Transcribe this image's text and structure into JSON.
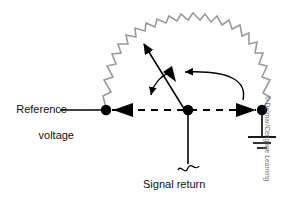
{
  "figure": {
    "type": "electrical-schematic",
    "background_color": "#ffffff",
    "wire_color": "#000000",
    "resistor_color": "#9a9a9a",
    "credit": "© Delmar/Cengage Learning"
  },
  "labels": {
    "reference_voltage_line1": "Reference",
    "reference_voltage_line2": "voltage",
    "signal_return": "Signal return"
  },
  "nodes": [
    {
      "name": "left-node",
      "x": 106,
      "y": 110
    },
    {
      "name": "center-node",
      "x": 188,
      "y": 110
    },
    {
      "name": "right-node",
      "x": 262,
      "y": 110
    }
  ],
  "elements": {
    "resistor_arc": {
      "name": "resistive-ground-path",
      "from_node": "left-node",
      "to_node": "right-node",
      "style": "zigzag-arc",
      "color": "#9a9a9a"
    },
    "dashed_line": {
      "name": "ground-current-path",
      "style": "dashed",
      "y": 110,
      "x_start": 112,
      "x_end": 256
    },
    "reference_wire": {
      "name": "reference-voltage-wire",
      "x_start": 60,
      "x_end": 106,
      "y": 110
    },
    "signal_return_wire": {
      "name": "signal-return-wire",
      "x": 188,
      "y_start": 110,
      "y_end": 168,
      "break_symbol": true
    },
    "earth_ground": {
      "name": "earth-ground-symbol",
      "x": 262,
      "y_top": 110,
      "y_bottom": 150,
      "bars": 3
    },
    "potential_arrow": {
      "name": "potential-difference-arrow",
      "from": [
        188,
        110
      ],
      "to": [
        139,
        34
      ],
      "double_headed": true
    },
    "current_arrow_left": {
      "name": "current-direction-arc-left",
      "arrow_points_down_at": [
        150,
        100
      ]
    },
    "current_arrow_right": {
      "name": "current-direction-arc-right",
      "arrow_points_down_at": [
        242,
        104
      ]
    },
    "flow_arrowheads": [
      {
        "name": "arrowhead-left-into-node",
        "x": 120,
        "y": 110,
        "direction": "left"
      },
      {
        "name": "arrowhead-right-into-node",
        "x": 250,
        "y": 110,
        "direction": "right"
      }
    ]
  }
}
